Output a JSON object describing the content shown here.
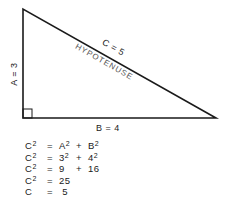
{
  "diagram": {
    "type": "right-triangle",
    "side_a_label": "A = 3",
    "side_b_label": "B = 4",
    "side_c_label": "C = 5",
    "hypotenuse_label": "HYPOTENUSE",
    "line_color": "#1a1a1a",
    "text_color": "#1a1a1a",
    "hypotenuse_text_color": "#555555"
  },
  "equations": [
    {
      "lhs": "C",
      "lhs_exp": "2",
      "eq": "=",
      "t1": "A",
      "t1_exp": "2",
      "op": "+",
      "t2": "B",
      "t2_exp": "2"
    },
    {
      "lhs": "C",
      "lhs_exp": "2",
      "eq": "=",
      "t1": "3",
      "t1_exp": "2",
      "op": "+",
      "t2": "4",
      "t2_exp": "2"
    },
    {
      "lhs": "C",
      "lhs_exp": "2",
      "eq": "=",
      "t1": "9",
      "t1_exp": "",
      "op": "+",
      "t2": "16",
      "t2_exp": ""
    },
    {
      "lhs": "C",
      "lhs_exp": "2",
      "eq": "=",
      "t1": "25",
      "t1_exp": "",
      "op": "",
      "t2": "",
      "t2_exp": ""
    },
    {
      "lhs": "C",
      "lhs_exp": "",
      "eq": "=",
      "t1": " 5",
      "t1_exp": "",
      "op": "",
      "t2": "",
      "t2_exp": ""
    }
  ]
}
